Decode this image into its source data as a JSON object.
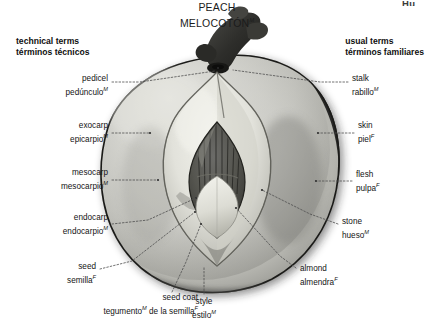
{
  "page": {
    "width": 434,
    "height": 336,
    "background": "#ffffff",
    "clipped_corner_text": "Hu"
  },
  "title": {
    "english": "PEACH",
    "spanish": "MELOCOTÓN",
    "spanish_gender_mark": "M"
  },
  "columns": {
    "left": {
      "english": "technical terms",
      "spanish": "términos técnicos"
    },
    "right": {
      "english": "usual terms",
      "spanish": "términos familiares"
    }
  },
  "labels": [
    {
      "id": "pedicel",
      "side": "left",
      "english": "pedicel",
      "spanish": "pedúnculo",
      "gender": "M",
      "x": 108,
      "y": 76,
      "align": "right",
      "leader": [
        [
          112,
          82
        ],
        [
          140,
          82
        ],
        [
          215,
          72
        ]
      ]
    },
    {
      "id": "exocarp",
      "side": "left",
      "english": "exocarp",
      "spanish": "epicarpio",
      "gender": "M",
      "x": 108,
      "y": 123,
      "align": "right",
      "leader": [
        [
          112,
          133
        ],
        [
          150,
          133
        ]
      ]
    },
    {
      "id": "mesocarp",
      "side": "left",
      "english": "mesocarp",
      "spanish": "mesocarpio",
      "gender": "M",
      "x": 108,
      "y": 170,
      "align": "right",
      "leader": [
        [
          112,
          180
        ],
        [
          158,
          180
        ]
      ]
    },
    {
      "id": "endocarp",
      "side": "left",
      "english": "endocarp",
      "spanish": "endocarpio",
      "gender": "M",
      "x": 108,
      "y": 215,
      "align": "right",
      "leader": [
        [
          112,
          224
        ],
        [
          146,
          220
        ],
        [
          196,
          198
        ]
      ]
    },
    {
      "id": "seed",
      "side": "left",
      "english": "seed",
      "spanish": "semilla",
      "gender": "F",
      "x": 96,
      "y": 265,
      "align": "right",
      "leader": [
        [
          100,
          269
        ],
        [
          130,
          262
        ],
        [
          195,
          212
        ]
      ]
    },
    {
      "id": "seed-coat",
      "side": "bottom-left",
      "english": "seed coat",
      "spanish": "tegumento# de la semilla",
      "spanish_part1": "tegumento",
      "gender": "M",
      "spanish_part2": " de la semilla",
      "gender2": "F",
      "x": 198,
      "y": 296,
      "align": "right",
      "leader": [
        [
          172,
          296
        ],
        [
          185,
          264
        ],
        [
          201,
          224
        ]
      ]
    },
    {
      "id": "style",
      "side": "bottom",
      "english": "style",
      "spanish": "estilo",
      "gender": "M",
      "x": 204,
      "y": 300,
      "align": "center",
      "leader": [
        [
          204,
          296
        ],
        [
          204,
          262
        ]
      ]
    },
    {
      "id": "stalk",
      "side": "right",
      "english": "stalk",
      "spanish": "rabillo",
      "gender": "M",
      "x": 352,
      "y": 76,
      "align": "left",
      "leader": [
        [
          348,
          82
        ],
        [
          320,
          82
        ],
        [
          232,
          70
        ]
      ]
    },
    {
      "id": "skin",
      "side": "right",
      "english": "skin",
      "spanish": "piel",
      "gender": "F",
      "x": 358,
      "y": 123,
      "align": "left",
      "leader": [
        [
          354,
          133
        ],
        [
          318,
          133
        ]
      ]
    },
    {
      "id": "flesh",
      "side": "right",
      "english": "flesh",
      "spanish": "pulpa",
      "gender": "F",
      "x": 356,
      "y": 172,
      "align": "left",
      "leader": [
        [
          352,
          181
        ],
        [
          316,
          181
        ]
      ]
    },
    {
      "id": "stone",
      "side": "right",
      "english": "stone",
      "spanish": "hueso",
      "gender": "M",
      "x": 342,
      "y": 219,
      "align": "left",
      "leader": [
        [
          338,
          224
        ],
        [
          310,
          214
        ],
        [
          262,
          190
        ]
      ]
    },
    {
      "id": "almond",
      "side": "right",
      "english": "almond",
      "spanish": "almendra",
      "gender": "F",
      "x": 300,
      "y": 266,
      "align": "left",
      "leader": [
        [
          296,
          270
        ],
        [
          282,
          258
        ],
        [
          236,
          208
        ]
      ]
    }
  ],
  "artwork": {
    "subject": "peach-cross-section",
    "palette": {
      "skin_outer": "#2b2b2b",
      "flesh_light": "#d2d2ce",
      "flesh_mid": "#b9b9b5",
      "flesh_shadow": "#8e8e8a",
      "stone_pale": "#e8e8e2",
      "stone_edge": "#3a3a38",
      "seed_dark": "#4a4a4a",
      "kernel": "#cfcfc8",
      "stem_dark": "#333333",
      "leader_line": "#5a5a5a"
    }
  }
}
